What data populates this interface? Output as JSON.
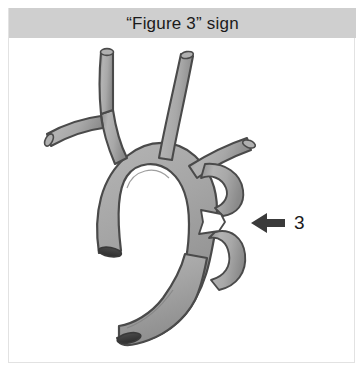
{
  "panel": {
    "title": "“Figure 3” sign",
    "header_background": "#cfcfcf",
    "body_background": "#ffffff",
    "border_color": "#e2e2e2"
  },
  "figure": {
    "kind": "anatomical-illustration",
    "vessel_fill": "#a6a6a6",
    "vessel_fill_light": "#c4c4c4",
    "vessel_outline": "#3d3d3d",
    "notch_fill": "#ffffff",
    "parts": [
      "brachiocephalic-trunk",
      "right-subclavian-artery",
      "right-common-carotid-artery",
      "left-common-carotid-artery",
      "left-subclavian-artery",
      "aortic-arch",
      "ascending-aorta",
      "descending-aorta",
      "coarctation-notch"
    ]
  },
  "annotation": {
    "arrow": {
      "icon": "arrow-left-icon",
      "color": "#3a3a3a",
      "direction": "left"
    },
    "label": "3",
    "label_color": "#1b1b1b"
  }
}
